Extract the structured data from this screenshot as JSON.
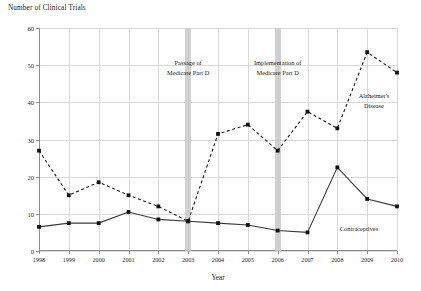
{
  "chart_data": {
    "type": "line",
    "title": "",
    "xlabel": "Year",
    "ylabel": "Number of Clinical Trials",
    "x": [
      1998,
      1999,
      2000,
      2001,
      2002,
      2003,
      2004,
      2005,
      2006,
      2007,
      2008,
      2009,
      2010
    ],
    "xtick_labels": [
      "1998",
      "1999",
      "2000",
      "2001",
      "2002",
      "2003",
      "2004",
      "2005",
      "2006",
      "2007",
      "2008",
      "2009",
      "2010"
    ],
    "ytick_labels": [
      "0",
      "10",
      "20",
      "30",
      "40",
      "50",
      "60"
    ],
    "yticks": [
      0,
      10,
      20,
      30,
      40,
      50,
      60
    ],
    "ylim": [
      0,
      60
    ],
    "xlim": [
      1998,
      2010
    ],
    "grid": true,
    "legend_position": "inline-annotations",
    "series": [
      {
        "name": "Alzheimer's Disease",
        "style": "dashed",
        "marker": "square",
        "color": "#1a1a1a",
        "values": [
          27,
          15,
          18.5,
          15,
          12,
          8,
          31.5,
          34,
          27,
          37.5,
          33,
          53.5,
          48
        ]
      },
      {
        "name": "Contraceptives",
        "style": "solid",
        "marker": "square",
        "color": "#3a3a3a",
        "values": [
          6.5,
          7.5,
          7.5,
          10.5,
          8.5,
          8,
          7.5,
          7,
          5.5,
          5,
          22.5,
          14,
          12
        ]
      }
    ],
    "annotations": [
      {
        "id": "passage",
        "line1": "Passage of",
        "line2": "Medicare Part D",
        "x": 2003,
        "band_color": "#c9c9c9"
      },
      {
        "id": "implementation",
        "line1": "Implementation of",
        "line2": "Medicare Part D",
        "x": 2006,
        "band_color": "#c9c9c9"
      }
    ],
    "series_labels": [
      {
        "id": "alzheimers",
        "line1": "Alzheimer's",
        "line2": "Disease"
      },
      {
        "id": "contraceptives",
        "line1": "Contraceptives",
        "line2": ""
      }
    ]
  }
}
